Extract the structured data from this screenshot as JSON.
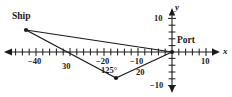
{
  "figure": {
    "type": "coordinate-plane-triangle-diagram",
    "background_color": "#ffffff",
    "ink_color": "#1a1a1a"
  },
  "axes": {
    "x_axis_label": "x",
    "y_axis_label": "y",
    "x_tick_labels": [
      {
        "text": "−40",
        "value": -40
      },
      {
        "text": "−20",
        "value": -20
      },
      {
        "text": "−10",
        "value": -10
      },
      {
        "text": "10",
        "value": 10
      }
    ],
    "y_tick_labels": [
      {
        "text": "10",
        "value": 10
      },
      {
        "text": "−10",
        "value": -10
      }
    ],
    "x_range": [
      -48,
      14
    ],
    "y_range": [
      -12,
      12
    ],
    "tick_interval": 2,
    "arrowheads": [
      "left",
      "right",
      "up",
      "down"
    ]
  },
  "points": [
    {
      "name": "Ship",
      "label": "Ship",
      "x": -43,
      "y": 6.5
    },
    {
      "name": "Port",
      "label": "Port",
      "x": 0,
      "y": 0
    },
    {
      "name": "Turn",
      "label": "",
      "x": -16.5,
      "y": -7.5
    }
  ],
  "sides": [
    {
      "label": "30",
      "from": "Ship",
      "to": "Turn"
    },
    {
      "label": "20",
      "from": "Turn",
      "to": "Port"
    }
  ],
  "angles": [
    {
      "label": "125°",
      "at": "Turn"
    }
  ]
}
